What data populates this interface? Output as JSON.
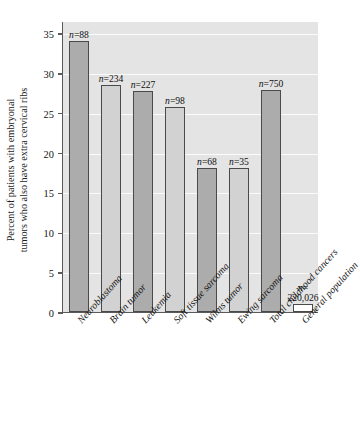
{
  "chart_data": {
    "type": "bar",
    "title": "",
    "xlabel": "",
    "ylabel": "Percent of patients with embryonal tumors who also have extra cervical ribs",
    "ylabel_lines": [
      "Percent of patients with embryonal",
      "tumors who also have extra cervical ribs"
    ],
    "ylim": [
      0,
      36.5
    ],
    "yticks": [
      0,
      5,
      10,
      15,
      20,
      25,
      30,
      35
    ],
    "ytick_labels": [
      "0",
      "5",
      "10",
      "15",
      "20",
      "25",
      "30",
      "35"
    ],
    "grid": "horizontal-white",
    "legend": "none",
    "categories": [
      "Neuroblastoma",
      "Brain tumor",
      "Leukemia",
      "Soft tissue sarcoma",
      "Wilms tumor",
      "Ewing sarcoma",
      "Total childhood cancers",
      "General population"
    ],
    "values": [
      34.0,
      28.5,
      27.7,
      25.7,
      18.1,
      18.1,
      27.8,
      1.0
    ],
    "bar_annotations": [
      "n=88",
      "n=234",
      "n=227",
      "n=98",
      "n=68",
      "n=35",
      "n=750",
      "n= 220,026"
    ],
    "sample_sizes": [
      88,
      234,
      227,
      98,
      68,
      35,
      750,
      220026
    ],
    "bar_shades": [
      "dark",
      "light",
      "dark",
      "light",
      "dark",
      "light",
      "dark",
      "white"
    ],
    "colors": {
      "plot_background": "#e4e4e4",
      "gridline": "#fbfbfb",
      "bar_dark": "#acacac",
      "bar_light": "#d2d2d2",
      "bar_white": "#fdfdfd",
      "bar_border": "#4a4a4a",
      "axis": "#5a5a5a",
      "text": "#141414"
    }
  },
  "annotation_prefix": "n",
  "annotation_values": [
    "=88",
    "=234",
    "=227",
    "=98",
    "=68",
    "=35",
    "=750",
    "="
  ],
  "general_population_n": "220,026"
}
